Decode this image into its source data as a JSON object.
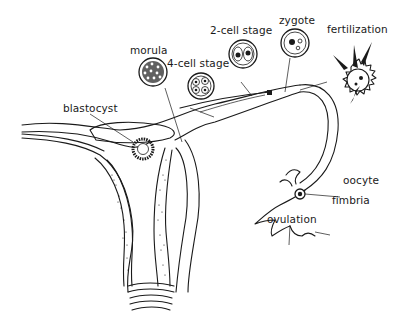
{
  "diagram": {
    "labels": {
      "morula": "morula",
      "four_cell": "4-cell stage",
      "two_cell": "2-cell stage",
      "zygote": "zygote",
      "fertilization": "fertilization",
      "blastocyst": "blastocyst",
      "oocyte": "oocyte",
      "fimbria": "fimbria",
      "ovulation": "ovulation"
    },
    "colors": {
      "ink": "#1a1a1a",
      "background": "#ffffff"
    }
  }
}
